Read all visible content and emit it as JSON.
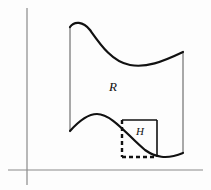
{
  "figure": {
    "type": "math-diagram",
    "background_color": "#fdfdfd",
    "labels": {
      "region_label": "R",
      "rectangle_label": "H"
    },
    "label_positions": {
      "region_label": {
        "x": 113,
        "y": 91,
        "font_size": 13
      },
      "rectangle_label": {
        "x": 140,
        "y": 135,
        "font_size": 11
      }
    },
    "colors": {
      "axis": "#8a8a8a",
      "curve": "#111111",
      "edge": "#555555",
      "dashed": "#111111"
    },
    "axes": {
      "vertical": {
        "x": 27,
        "y_top": 8,
        "y_bottom": 185,
        "width": 1.2
      },
      "horizontal": {
        "y": 170,
        "x_left": 8,
        "x_right": 203,
        "width": 1.2
      }
    },
    "region_R": {
      "top_curve": "M 70 27 C 74 21, 83 21, 90 30 C 100 44, 112 62, 130 65 C 146 68, 162 62, 183 52",
      "bottom_curve": "M 70 131 C 78 122, 88 114, 97 114 C 112 114, 128 136, 145 150 C 155 157, 166 160, 183 153",
      "left_edge": {
        "x": 70,
        "y_top": 27,
        "y_bottom": 131,
        "width": 1
      },
      "right_edge": {
        "x": 183,
        "y_top": 52,
        "y_bottom": 153,
        "width": 1
      },
      "curve_width": 2.2
    },
    "rectangle_H": {
      "left": 122,
      "right": 157,
      "top": 120,
      "bottom": 157,
      "solid_edges": [
        "top",
        "right"
      ],
      "dashed_edges": [
        "left",
        "bottom"
      ],
      "solid_width": 1.6,
      "dash_width": 2.4,
      "dash_pattern": "4,3"
    }
  }
}
